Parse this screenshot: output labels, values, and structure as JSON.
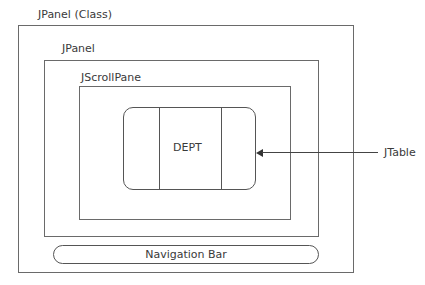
{
  "diagram": {
    "outer_panel": {
      "label": "JPanel (Class)"
    },
    "inner_panel": {
      "label": "JPanel"
    },
    "scroll_pane": {
      "label": "JScrollPane"
    },
    "table": {
      "cell_label": "DEPT",
      "callout_label": "JTable"
    },
    "navigation_bar": {
      "label": "Navigation Bar"
    }
  }
}
